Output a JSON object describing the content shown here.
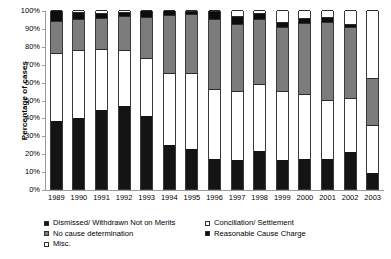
{
  "chart_data": {
    "type": "bar",
    "subtype": "stacked-percentage-column",
    "title": "",
    "xlabel": "",
    "ylabel": "Percentage of cases",
    "ylim": [
      0,
      100
    ],
    "ytick_labels": [
      "100%",
      "90%",
      "80%",
      "70%",
      "60%",
      "50%",
      "40%",
      "30%",
      "20%",
      "10%",
      "0%"
    ],
    "ytick_values": [
      100,
      90,
      80,
      70,
      60,
      50,
      40,
      30,
      20,
      10,
      0
    ],
    "grid": false,
    "legend_position": "bottom",
    "categories": [
      "1989",
      "1990",
      "1991",
      "1992",
      "1993",
      "1994",
      "1995",
      "1996",
      "1997",
      "1998",
      "1999",
      "2000",
      "2001",
      "2002",
      "2003"
    ],
    "series": [
      {
        "name": "Dismissed/ Withdrawn Not on Merits",
        "color": "#141414",
        "values": [
          38,
          39.5,
          44,
          46.5,
          41,
          24.5,
          22.5,
          16.5,
          16,
          21,
          16,
          17,
          17,
          20.5,
          9
        ]
      },
      {
        "name": "Conciliation/ Settlement",
        "color": "#ffffff",
        "pattern": "fine-dots",
        "values": [
          38,
          38,
          34,
          31,
          32,
          40.5,
          42.5,
          39.5,
          38.5,
          37.5,
          39,
          36,
          33,
          30.5,
          27
        ]
      },
      {
        "name": "No cause determination",
        "color": "#7c7c7c",
        "values": [
          18,
          17.5,
          17.5,
          19,
          23,
          32,
          32.5,
          39,
          37.5,
          36.5,
          35.5,
          40,
          43.5,
          39.5,
          26
        ]
      },
      {
        "name": "Reasonable Cause Charge",
        "color": "#0d0d0d",
        "values": [
          6,
          4,
          3,
          2.5,
          4,
          3,
          2,
          4.5,
          4.5,
          3.5,
          3,
          2.5,
          2.5,
          1.5,
          0
        ]
      },
      {
        "name": "Misc.",
        "color": "#ffffff",
        "values": [
          0,
          1,
          1.5,
          1,
          0,
          0,
          0.5,
          0.5,
          3.5,
          1.5,
          6.5,
          4.5,
          4,
          8,
          38
        ]
      }
    ]
  },
  "legend": {
    "left_items": [
      {
        "label": "Dismissed/ Withdrawn Not on Merits",
        "key": "k-dismissed"
      },
      {
        "label": "No cause determination",
        "key": "k-nocause"
      },
      {
        "label": "Misc.",
        "key": "k-misc"
      }
    ],
    "right_items": [
      {
        "label": "Conciliation/ Settlement",
        "key": "k-concil"
      },
      {
        "label": "Reasonable Cause Charge",
        "key": "k-reasonable"
      }
    ]
  }
}
